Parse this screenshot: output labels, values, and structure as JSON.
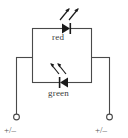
{
  "diagram": {
    "type": "schematic",
    "background_color": "#ffffff",
    "line_color": "#4a4a4a",
    "text_color": "#3b3b3b",
    "components": {
      "red_led": {
        "label": "red",
        "symbol": "led-diode",
        "direction": "right",
        "emission_arrows": 2,
        "emission_direction": "up-right"
      },
      "green_led": {
        "label": "green",
        "symbol": "led-diode",
        "direction": "left",
        "emission_arrows": 2,
        "emission_direction": "up-left"
      }
    },
    "terminals": {
      "left": {
        "label": "+/–",
        "marker": "open-circle"
      },
      "right": {
        "label": "+/–",
        "marker": "open-circle"
      }
    }
  }
}
